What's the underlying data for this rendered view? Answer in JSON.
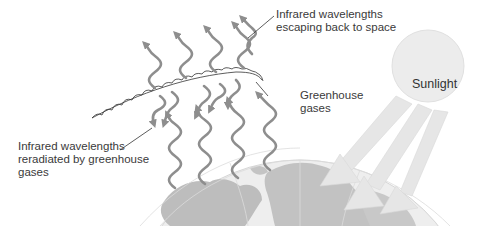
{
  "diagram": {
    "topic": "greenhouse effect",
    "labels": {
      "escaping": [
        "Infrared wavelengths",
        "escaping back to space"
      ],
      "greenhouse_gases": [
        "Greenhouse",
        "gases"
      ],
      "reradiated": [
        "Infrared wavelengths",
        "reradiated by greenhouse",
        "gases"
      ],
      "sunlight": "Sunlight"
    },
    "colors": {
      "wave_arrows": "#8e8e8e",
      "sun": "#ececec",
      "sunbeams": "#e4e4e4",
      "globe_ocean": "#ededed",
      "globe_land": "#bdbdbd",
      "gas_layer": "#333333",
      "text": "#3a3a3a"
    },
    "elements": {
      "escaping_arrows_count": 5,
      "reradiated_arrows_count": 5,
      "incoming_wave_count": 4,
      "sunbeam_count": 3
    }
  }
}
